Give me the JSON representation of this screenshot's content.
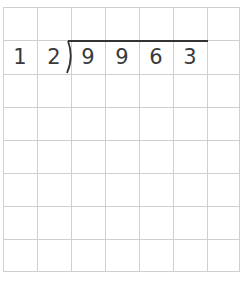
{
  "problem": {
    "type": "long-division",
    "divisor": [
      "1",
      "2"
    ],
    "dividend": [
      "9",
      "9",
      "6",
      "3"
    ]
  },
  "grid": {
    "columns": 7,
    "rows": 8,
    "line_color": "#cfcfcf"
  },
  "colors": {
    "digit": "#3a3a3a",
    "vinculum": "#333333"
  }
}
